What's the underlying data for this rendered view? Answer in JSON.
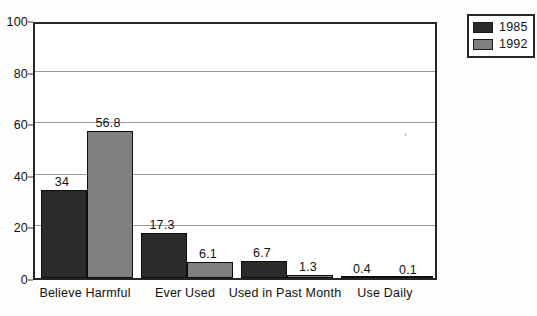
{
  "chart_data": {
    "type": "bar",
    "title": "",
    "xlabel": "",
    "ylabel": "",
    "ylim": [
      0,
      100
    ],
    "yticks": [
      0,
      20,
      40,
      60,
      80,
      100
    ],
    "grid": true,
    "legend_position": "top-right outside",
    "categories": [
      "Believe Harmful",
      "Ever Used",
      "Used in Past Month",
      "Use Daily"
    ],
    "series": [
      {
        "name": "1985",
        "color": "#2b2b2b",
        "values": [
          34,
          17.3,
          6.7,
          0.4
        ],
        "labels": [
          "34",
          "17.3",
          "6.7",
          "0.4"
        ]
      },
      {
        "name": "1992",
        "color": "#7f7f7f",
        "values": [
          56.8,
          6.1,
          1.3,
          0.1
        ],
        "labels": [
          "56.8",
          "6.1",
          "1.3",
          "0.1"
        ]
      }
    ]
  },
  "legend": {
    "entries": [
      {
        "label": "1985"
      },
      {
        "label": "1992"
      }
    ]
  },
  "axis": {
    "y_tick_labels": [
      "0",
      "20",
      "40",
      "60",
      "80",
      "100"
    ]
  },
  "colors": {
    "series_1985": "#2b2b2b",
    "series_1992": "#7f7f7f",
    "frame": "#262626",
    "gridline": "#9a9a9a",
    "background": "#fdfdfb"
  }
}
